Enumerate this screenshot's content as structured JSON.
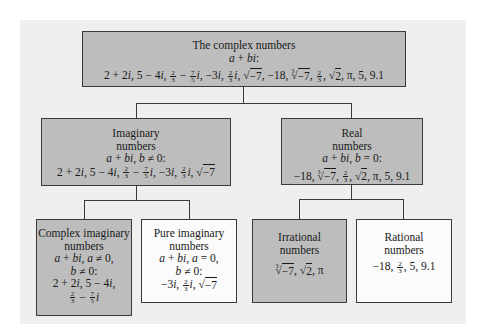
{
  "diagram": {
    "colors": {
      "panel_bg": "#efefef",
      "gray_box": "#bdbdbd",
      "white_box": "#fbfbfb",
      "border": "#3a3a3a"
    },
    "nodes": {
      "complex": {
        "title": "The complex numbers",
        "condition": "a + bi:",
        "examples": "2 + 2i, 5 − 4i, 2/3 − 7/5 i, −3i, 2/3 i, √−7, −18, ∛−7, 2/3, √2, π, 5, 9.1",
        "style": "gray"
      },
      "imaginary": {
        "title_line1": "Imaginary",
        "title_line2": "numbers",
        "condition": "a + bi, b ≠ 0:",
        "examples": "2 + 2i, 5 − 4i, 2/3 − 7/5 i, −3i, 2/3 i, √−7",
        "style": "gray"
      },
      "real": {
        "title_line1": "Real",
        "title_line2": "numbers",
        "condition": "a + bi, b = 0:",
        "examples": "−18, ∛−7, 2/3, √2, π, 5, 9.1",
        "style": "gray"
      },
      "complex_imaginary": {
        "title_line1": "Complex imaginary",
        "title_line2": "numbers",
        "condition_line1": "a + bi, a ≠ 0,",
        "condition_line2": "b ≠ 0:",
        "examples_line1": "2 + 2i, 5 − 4i,",
        "examples_line2": "2/3 − 7/5 i",
        "style": "gray"
      },
      "pure_imaginary": {
        "title_line1": "Pure imaginary",
        "title_line2": "numbers",
        "condition_line1": "a + bi, a = 0,",
        "condition_line2": "b ≠ 0:",
        "examples": "−3i, 2/3 i, √−7",
        "style": "white"
      },
      "irrational": {
        "title_line1": "Irrational",
        "title_line2": "numbers",
        "examples": "∛−7, √2, π",
        "style": "gray"
      },
      "rational": {
        "title_line1": "Rational",
        "title_line2": "numbers",
        "examples": "−18, 2/3, 5, 9.1",
        "style": "white"
      }
    },
    "edges": [
      {
        "from": "complex",
        "to": "imaginary"
      },
      {
        "from": "complex",
        "to": "real"
      },
      {
        "from": "imaginary",
        "to": "complex_imaginary"
      },
      {
        "from": "imaginary",
        "to": "pure_imaginary"
      },
      {
        "from": "real",
        "to": "irrational"
      },
      {
        "from": "real",
        "to": "rational"
      }
    ],
    "glyphs": {
      "a": "a",
      "b": "b",
      "bi": "bi",
      "i": "i",
      "plus": " + ",
      "minus": " − ",
      "neg": "−",
      "neq": " ≠ ",
      "eq": " = ",
      "comma": ", ",
      "colon": ":",
      "pi": "π",
      "n2": "2",
      "n3": "3",
      "n5": "5",
      "n7": "7",
      "n0": "0",
      "n18": "18",
      "n9_1": "9.1",
      "root3_idx": "3"
    }
  }
}
